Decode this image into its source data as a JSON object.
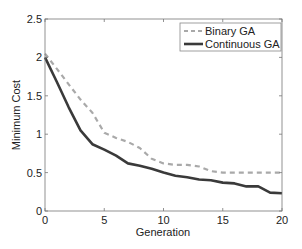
{
  "chart_data": {
    "type": "line",
    "title": "",
    "xlabel": "Generation",
    "ylabel": "Minimum Cost",
    "xlim": [
      0,
      20
    ],
    "ylim": [
      0,
      2.5
    ],
    "xticks": [
      0,
      5,
      10,
      15,
      20
    ],
    "yticks": [
      0,
      0.5,
      1,
      1.5,
      2,
      2.5
    ],
    "xtick_labels": [
      "0",
      "5",
      "10",
      "15",
      "20"
    ],
    "ytick_labels": [
      "0",
      "0.5",
      "1",
      "1.5",
      "2",
      "2.5"
    ],
    "grid": false,
    "legend_position": "upper right",
    "x": [
      0,
      1,
      2,
      3,
      4,
      5,
      6,
      7,
      8,
      9,
      10,
      11,
      12,
      13,
      14,
      15,
      16,
      17,
      18,
      19,
      20
    ],
    "series": [
      {
        "name": "Binary GA",
        "style": "dashed",
        "color": "#a9a9a9",
        "values": [
          2.05,
          1.85,
          1.65,
          1.45,
          1.28,
          1.02,
          0.95,
          0.9,
          0.82,
          0.68,
          0.62,
          0.6,
          0.6,
          0.58,
          0.52,
          0.5,
          0.5,
          0.5,
          0.5,
          0.5,
          0.5
        ]
      },
      {
        "name": "Continuous GA",
        "style": "solid",
        "color": "#3a3a3a",
        "values": [
          2.0,
          1.68,
          1.35,
          1.05,
          0.87,
          0.8,
          0.72,
          0.62,
          0.59,
          0.55,
          0.5,
          0.46,
          0.44,
          0.41,
          0.4,
          0.37,
          0.36,
          0.32,
          0.32,
          0.24,
          0.23
        ]
      }
    ]
  }
}
